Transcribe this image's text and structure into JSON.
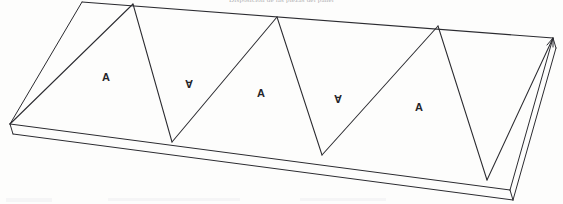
{
  "figure": {
    "title_caption": "Disposición de las piezas del panel",
    "bottom_caption": "",
    "background_color": "#fdfdfc",
    "line_color": "#2b2b30",
    "label_color": "#25252a",
    "width": 563,
    "height": 204
  },
  "labels": [
    {
      "text": "A",
      "x": 106,
      "y": 78,
      "rotated": false
    },
    {
      "text": "A",
      "x": 189,
      "y": 85,
      "rotated": true
    },
    {
      "text": "A",
      "x": 261,
      "y": 94,
      "rotated": false
    },
    {
      "text": "A",
      "x": 338,
      "y": 100,
      "rotated": true
    },
    {
      "text": "A",
      "x": 419,
      "y": 108,
      "rotated": false
    }
  ],
  "geometry": {
    "description": "Isometric view of a rectangular slab whose top face is divided into five alternating triangular panels forming a zigzag seam.",
    "slab_top_face": {
      "back_left": [
        82,
        2
      ],
      "back_right": [
        553,
        38
      ],
      "front_right": [
        510,
        190
      ],
      "front_left": [
        10,
        124
      ]
    },
    "slab_thickness_px": 10,
    "zigzag_apex_points": [
      [
        133,
        4
      ],
      [
        277,
        17
      ],
      [
        438,
        26
      ]
    ],
    "zigzag_valley_points": [
      [
        172,
        142
      ],
      [
        322,
        155
      ],
      [
        487,
        180
      ]
    ],
    "seam_polyline": [
      [
        10,
        124
      ],
      [
        133,
        4
      ],
      [
        172,
        142
      ],
      [
        277,
        17
      ],
      [
        322,
        155
      ],
      [
        438,
        26
      ],
      [
        487,
        180
      ]
    ]
  }
}
